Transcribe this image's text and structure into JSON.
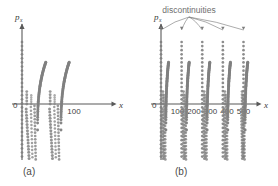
{
  "figure": {
    "background": "#ffffff",
    "ink_color": "#808080",
    "axis_color": "#595959",
    "text_color": "#3f3f3f",
    "annotation_color": "#777777"
  },
  "panels": [
    {
      "id": "a",
      "caption": "(a)",
      "y_axis_label": "p",
      "y_axis_sub": "x",
      "x_axis_label": "x",
      "origin_label": "0",
      "x_ticks": [
        {
          "label": "100",
          "value": 100
        }
      ],
      "x_range": [
        -20,
        160
      ],
      "n_discontinuity_columns": 1,
      "n_arcs": 2
    },
    {
      "id": "b",
      "caption": "(b)",
      "y_axis_label": "p",
      "y_axis_sub": "x",
      "x_axis_label": "x",
      "origin_label": "0",
      "x_ticks": [
        {
          "label": "100",
          "value": 100
        },
        {
          "label": "200",
          "value": 200
        },
        {
          "label": "300",
          "value": 300
        },
        {
          "label": "400",
          "value": 400
        },
        {
          "label": "500",
          "value": 500
        }
      ],
      "x_range": [
        -20,
        580
      ],
      "annotation": "discontinuities",
      "n_discontinuity_columns": 5,
      "n_arcs": 5
    }
  ],
  "chart_data": {
    "type": "scatter",
    "title": "",
    "xlabel": "x",
    "ylabel": "p_x",
    "grid": false,
    "legend": null,
    "panel_a": {
      "xlim": [
        -20,
        160
      ],
      "ylim": [
        -120,
        110
      ],
      "discontinuity_columns_x": [
        0
      ],
      "arc_starts_x": [
        30,
        75
      ],
      "tick_values": [
        0,
        100
      ]
    },
    "panel_b": {
      "xlim": [
        -20,
        580
      ],
      "ylim": [
        -120,
        110
      ],
      "discontinuity_columns_x": [
        0,
        125,
        250,
        375,
        500
      ],
      "arc_starts_x": [
        30,
        155,
        280,
        405,
        510
      ],
      "tick_values": [
        0,
        100,
        200,
        300,
        400,
        500
      ],
      "annotation_text": "discontinuities",
      "annotation_targets_x": [
        0,
        125,
        250,
        375,
        500
      ]
    }
  }
}
